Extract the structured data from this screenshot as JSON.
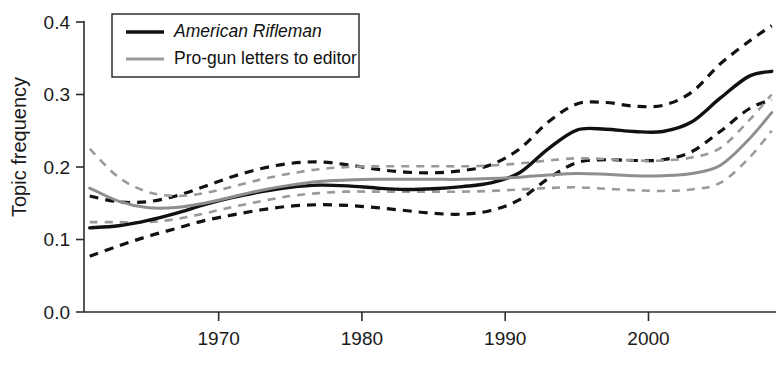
{
  "chart_data": {
    "type": "line",
    "title": "",
    "xlabel": "",
    "ylabel": "Topic frequency",
    "xlim": [
      1960.6,
      2008.9
    ],
    "ylim": [
      0.0,
      0.42
    ],
    "grid": false,
    "legend_position": "top-left",
    "x_ticks": [
      1970,
      1980,
      1990,
      2000
    ],
    "x_tick_labels": [
      "1970",
      "1980",
      "1990",
      "2000"
    ],
    "y_ticks": [
      0.0,
      0.1,
      0.2,
      0.3,
      0.4
    ],
    "y_tick_labels": [
      "0.0",
      "0.1",
      "0.2",
      "0.3",
      "0.4"
    ],
    "x": [
      1961.0,
      1963.0,
      1965.0,
      1967.0,
      1969.0,
      1971.0,
      1973.0,
      1975.0,
      1977.0,
      1979.0,
      1981.0,
      1983.0,
      1985.0,
      1987.0,
      1989.0,
      1991.0,
      1993.0,
      1995.0,
      1997.0,
      1999.0,
      2001.0,
      2003.0,
      2005.0,
      2007.0,
      2008.6
    ],
    "series": [
      {
        "name": "American Rifleman",
        "style": "solid",
        "color": "#111111",
        "values": [
          0.116,
          0.119,
          0.126,
          0.136,
          0.148,
          0.158,
          0.166,
          0.172,
          0.175,
          0.174,
          0.171,
          0.169,
          0.17,
          0.173,
          0.178,
          0.192,
          0.225,
          0.251,
          0.252,
          0.249,
          0.249,
          0.262,
          0.295,
          0.325,
          0.332
        ]
      },
      {
        "name": "American Rifleman upper CI",
        "style": "dashed",
        "color": "#111111",
        "values": [
          0.16,
          0.152,
          0.152,
          0.16,
          0.173,
          0.187,
          0.198,
          0.205,
          0.207,
          0.203,
          0.197,
          0.193,
          0.192,
          0.195,
          0.203,
          0.225,
          0.262,
          0.287,
          0.289,
          0.284,
          0.285,
          0.303,
          0.342,
          0.373,
          0.395
        ]
      },
      {
        "name": "American Rifleman lower CI",
        "style": "dashed",
        "color": "#111111",
        "values": [
          0.077,
          0.091,
          0.104,
          0.115,
          0.126,
          0.134,
          0.141,
          0.146,
          0.148,
          0.147,
          0.144,
          0.14,
          0.136,
          0.135,
          0.14,
          0.155,
          0.184,
          0.206,
          0.21,
          0.209,
          0.21,
          0.221,
          0.249,
          0.28,
          0.293
        ]
      },
      {
        "name": "Pro-gun letters to editor",
        "style": "solid",
        "color": "#8e8e8e",
        "values": [
          0.171,
          0.153,
          0.144,
          0.144,
          0.15,
          0.159,
          0.168,
          0.175,
          0.18,
          0.182,
          0.183,
          0.183,
          0.183,
          0.183,
          0.184,
          0.186,
          0.189,
          0.191,
          0.19,
          0.188,
          0.188,
          0.191,
          0.202,
          0.238,
          0.275
        ]
      },
      {
        "name": "Pro-gun letters upper CI",
        "style": "dashed",
        "color": "#9a9a9a",
        "values": [
          0.225,
          0.186,
          0.166,
          0.16,
          0.164,
          0.173,
          0.183,
          0.191,
          0.197,
          0.2,
          0.201,
          0.201,
          0.201,
          0.201,
          0.202,
          0.205,
          0.209,
          0.212,
          0.211,
          0.209,
          0.209,
          0.213,
          0.226,
          0.264,
          0.3
        ]
      },
      {
        "name": "Pro-gun letters lower CI",
        "style": "dashed",
        "color": "#9a9a9a",
        "values": [
          0.124,
          0.124,
          0.124,
          0.128,
          0.136,
          0.145,
          0.153,
          0.16,
          0.164,
          0.166,
          0.166,
          0.166,
          0.166,
          0.166,
          0.167,
          0.169,
          0.171,
          0.172,
          0.17,
          0.168,
          0.167,
          0.169,
          0.178,
          0.212,
          0.25
        ]
      }
    ],
    "legend": [
      {
        "label": "American Rifleman",
        "style": "solid",
        "color": "#111111",
        "italic": true
      },
      {
        "label": "Pro-gun letters to editor",
        "style": "solid",
        "color": "#9a9a9a",
        "italic": false
      }
    ]
  }
}
